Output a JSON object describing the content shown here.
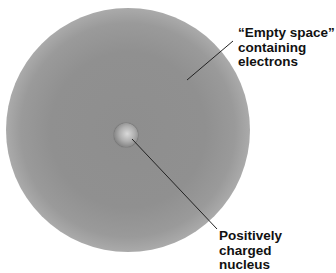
{
  "diagram": {
    "labels": {
      "electron_cloud": {
        "line1": "“Empty space”",
        "line2": "containing",
        "line3": "electrons"
      },
      "nucleus": {
        "line1": "Positively charged",
        "line2": "nucleus"
      }
    },
    "colors": {
      "cloud": "#8e8e8e",
      "nucleus": "#b0b0b0",
      "text": "#111111",
      "leader": "#222222"
    }
  }
}
